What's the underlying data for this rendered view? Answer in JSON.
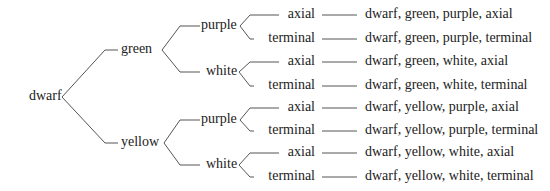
{
  "diagram": {
    "type": "tree",
    "root": {
      "label": "dwarf",
      "children": [
        {
          "label": "green",
          "children": [
            {
              "label": "purple",
              "children": [
                {
                  "label": "axial",
                  "outcome": "dwarf, green, purple, axial"
                },
                {
                  "label": "terminal",
                  "outcome": "dwarf, green, purple, terminal"
                }
              ]
            },
            {
              "label": "white",
              "children": [
                {
                  "label": "axial",
                  "outcome": "dwarf, green, white, axial"
                },
                {
                  "label": "terminal",
                  "outcome": "dwarf, green, white, terminal"
                }
              ]
            }
          ]
        },
        {
          "label": "yellow",
          "children": [
            {
              "label": "purple",
              "children": [
                {
                  "label": "axial",
                  "outcome": "dwarf, yellow, purple, axial"
                },
                {
                  "label": "terminal",
                  "outcome": "dwarf, yellow, purple, terminal"
                }
              ]
            },
            {
              "label": "white",
              "children": [
                {
                  "label": "axial",
                  "outcome": "dwarf, yellow, white, axial"
                },
                {
                  "label": "terminal",
                  "outcome": "dwarf, yellow, white, terminal"
                }
              ]
            }
          ]
        }
      ]
    }
  }
}
